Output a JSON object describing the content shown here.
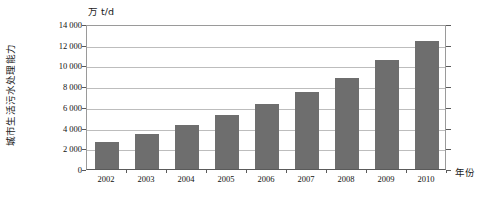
{
  "chart_data": {
    "type": "bar",
    "title": "",
    "subtitle": "",
    "unit_label": "万 t/d",
    "xlabel": "年份",
    "ylabel": "城市生活污水处理能力",
    "categories": [
      "2002",
      "2003",
      "2004",
      "2005",
      "2006",
      "2007",
      "2008",
      "2009",
      "2010"
    ],
    "values": [
      2600,
      3400,
      4250,
      5250,
      6300,
      7400,
      8800,
      10500,
      12400
    ],
    "series": [
      {
        "name": "城市生活污水处理能力",
        "values": [
          2600,
          3400,
          4250,
          5250,
          6300,
          7400,
          8800,
          10500,
          12400
        ]
      }
    ],
    "ylim": [
      0,
      14000
    ],
    "ytick_values": [
      0,
      2000,
      4000,
      6000,
      8000,
      10000,
      12000,
      14000
    ],
    "ytick_labels": [
      "0",
      "2 000",
      "4 000",
      "6 000",
      "8 000",
      "10 000",
      "12 000",
      "14 000"
    ],
    "grid": true,
    "legend": "none",
    "bar_color": "#6e6e6e",
    "grid_color": "#bdbdbd",
    "axis_color": "#5a5a5a",
    "background": "#ffffff"
  }
}
